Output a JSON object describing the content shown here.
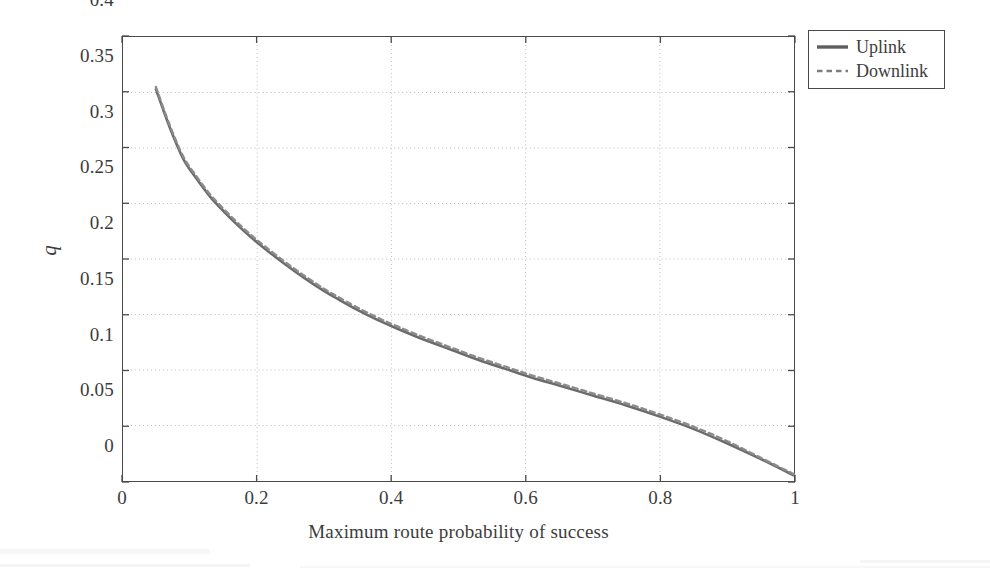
{
  "chart_data": {
    "type": "line",
    "title": "",
    "xlabel": "Maximum route probability of success",
    "ylabel": "q",
    "xlim": [
      0,
      1
    ],
    "ylim": [
      0,
      0.4
    ],
    "xticks": [
      "0",
      "0.2",
      "0.4",
      "0.6",
      "0.8",
      "1"
    ],
    "xtick_values": [
      0,
      0.2,
      0.4,
      0.6,
      0.8,
      1
    ],
    "yticks": [
      "0",
      "0.05",
      "0.1",
      "0.15",
      "0.2",
      "0.25",
      "0.3",
      "0.35",
      "0.4"
    ],
    "ytick_values": [
      0,
      0.05,
      0.1,
      0.15,
      0.2,
      0.25,
      0.3,
      0.35,
      0.4
    ],
    "grid": true,
    "grid_style": "dotted",
    "legend_position": "outside-top-right",
    "line_color": "#6b6b6b",
    "series": [
      {
        "name": "Uplink",
        "style": "solid",
        "color": "#6b6b6b",
        "x": [
          0.049,
          0.07,
          0.09,
          0.11,
          0.13,
          0.15,
          0.17,
          0.19,
          0.21,
          0.24,
          0.27,
          0.3,
          0.32,
          0.35,
          0.38,
          0.41,
          0.45,
          0.49,
          0.53,
          0.57,
          0.61,
          0.65,
          0.7,
          0.75,
          0.8,
          0.85,
          0.9,
          0.95,
          1.0
        ],
        "y": [
          0.353,
          0.318,
          0.29,
          0.272,
          0.256,
          0.243,
          0.231,
          0.22,
          0.21,
          0.196,
          0.183,
          0.171,
          0.164,
          0.154,
          0.145,
          0.137,
          0.127,
          0.118,
          0.109,
          0.101,
          0.093,
          0.086,
          0.077,
          0.068,
          0.058,
          0.047,
          0.034,
          0.02,
          0.005
        ]
      },
      {
        "name": "Downlink",
        "style": "dashed",
        "color": "#8c8c8c",
        "x": [
          0.049,
          0.07,
          0.09,
          0.11,
          0.13,
          0.15,
          0.17,
          0.19,
          0.21,
          0.24,
          0.27,
          0.3,
          0.32,
          0.35,
          0.38,
          0.41,
          0.45,
          0.49,
          0.53,
          0.57,
          0.61,
          0.65,
          0.7,
          0.75,
          0.8,
          0.85,
          0.9,
          0.95,
          1.0
        ],
        "y": [
          0.355,
          0.32,
          0.292,
          0.274,
          0.258,
          0.245,
          0.233,
          0.222,
          0.212,
          0.198,
          0.185,
          0.173,
          0.166,
          0.156,
          0.147,
          0.139,
          0.129,
          0.12,
          0.111,
          0.103,
          0.095,
          0.088,
          0.079,
          0.07,
          0.06,
          0.049,
          0.036,
          0.021,
          0.006
        ]
      }
    ]
  },
  "legend": {
    "items": [
      {
        "label": "Uplink",
        "style": "solid"
      },
      {
        "label": "Downlink",
        "style": "dashed"
      }
    ]
  }
}
